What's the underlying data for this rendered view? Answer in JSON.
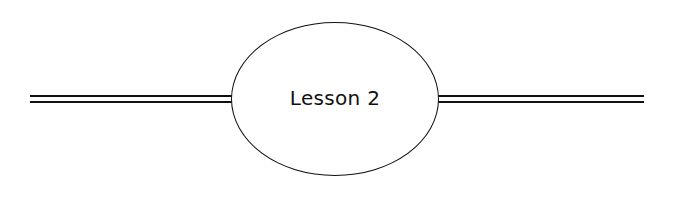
{
  "heading": {
    "title": "Lesson 2",
    "line_color": "#111111"
  }
}
